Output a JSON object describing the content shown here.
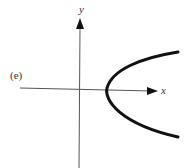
{
  "figure": {
    "part_label": "(e)",
    "x_axis_label": "x",
    "y_axis_label": "y",
    "curve": {
      "type": "parabola",
      "orientation": "opens-right",
      "description": "Parabola x = a*y^2 + c with vertex on positive x-axis"
    },
    "colors": {
      "axis": "#555555",
      "curve": "#111111",
      "background": "#ffffff"
    }
  }
}
